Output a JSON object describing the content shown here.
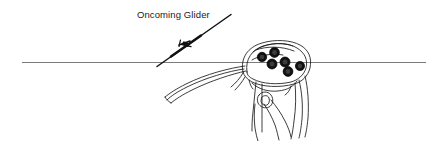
{
  "figure": {
    "name": "oncoming-glider-horizon-diagram",
    "type": "line-art-illustration",
    "background_color": "#ffffff",
    "ink_color": "#1a1a1a",
    "horizon_color": "#6b6b6b",
    "width": 439,
    "height": 141
  },
  "annotations": {
    "oncoming_glider_label": "Oncoming Glider"
  },
  "scene": {
    "horizon": {
      "name": "horizon-line",
      "x_start": 22,
      "x_end": 426,
      "y": 62
    },
    "oncoming_glider": {
      "name": "distant-glider-silhouette",
      "wing_line_start_x": 157,
      "wing_line_start_y": 66,
      "wing_line_end_x": 231,
      "wing_line_end_y": 15,
      "fuselage_mark_x": 186,
      "fuselage_mark_y": 42
    },
    "cockpit": {
      "name": "glider-cockpit-canopy-view",
      "instrument_count": 6,
      "instruments": [
        {
          "name": "instrument-gauge-1",
          "cx": 262,
          "cy": 57,
          "r": 4.6
        },
        {
          "name": "instrument-gauge-2",
          "cx": 274,
          "cy": 53,
          "r": 4.8
        },
        {
          "name": "instrument-gauge-3",
          "cx": 272,
          "cy": 64,
          "r": 4.8
        },
        {
          "name": "instrument-gauge-4",
          "cx": 285,
          "cy": 62,
          "r": 4.8
        },
        {
          "name": "instrument-gauge-5",
          "cx": 288,
          "cy": 71,
          "r": 4.8
        },
        {
          "name": "instrument-gauge-6",
          "cx": 300,
          "cy": 66,
          "r": 4.6
        }
      ]
    }
  }
}
